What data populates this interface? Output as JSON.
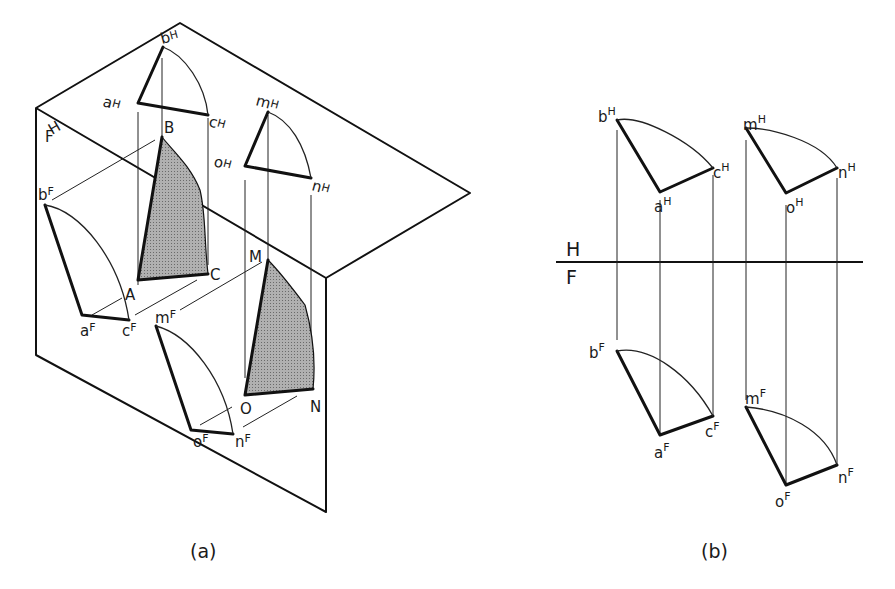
{
  "figure_a": {
    "caption": "(a)",
    "plane_labels": {
      "horizontal": "H",
      "frontal": "F"
    },
    "space_points": {
      "A": "A",
      "B": "B",
      "C": "C",
      "M": "M",
      "N": "N",
      "O": "O"
    },
    "h_projections": {
      "a": "a",
      "b": "b",
      "c": "c",
      "m": "m",
      "n": "n",
      "o": "o",
      "sup": "H"
    },
    "f_projections": {
      "a": "a",
      "b": "b",
      "c": "c",
      "m": "m",
      "n": "n",
      "o": "o",
      "sup": "F"
    },
    "fill_color": "#a6a6a6"
  },
  "figure_b": {
    "caption": "(b)",
    "fold_line": {
      "upper": "H",
      "lower": "F"
    },
    "h_projections": {
      "a": "a",
      "b": "b",
      "c": "c",
      "m": "m",
      "n": "n",
      "o": "o",
      "sup": "H"
    },
    "f_projections": {
      "a": "a",
      "b": "b",
      "c": "c",
      "m": "m",
      "n": "n",
      "o": "o",
      "sup": "F"
    }
  }
}
